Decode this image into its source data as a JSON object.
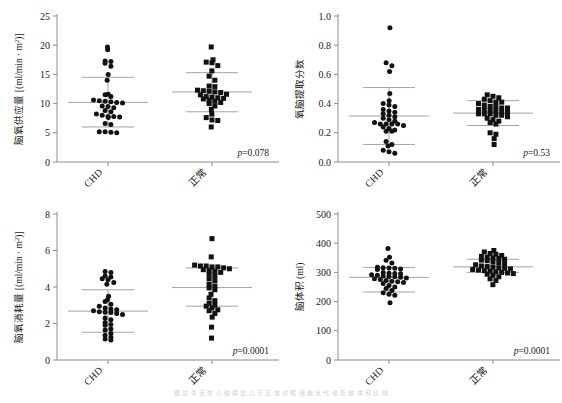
{
  "figure": {
    "caption": "图 注 先 天 性 心 脏 病 患 儿 与 正 常 对 照 组 脑 氧 代 谢 及 脑 体 积 比 较",
    "groups": [
      "CHD",
      "正常"
    ],
    "panel_count": 4
  },
  "chart_data": [
    {
      "id": "panel-brain-oxygen-delivery",
      "position": "top-left",
      "type": "scatter",
      "title": "",
      "xlabel": "",
      "ylabel": "脑氧供应量 [(ml/min · m²)]",
      "ylabel_main": "脑氧供应量",
      "ylabel_unit": "[(ml/min · m",
      "ylabel_exp": "2",
      "ylabel_tail": ")]",
      "ylim": [
        0,
        25
      ],
      "yticks": [
        0,
        5,
        10,
        15,
        20,
        25
      ],
      "ytick_labels": [
        "0",
        "5",
        "10",
        "15",
        "20",
        "25"
      ],
      "categories": [
        "CHD",
        "正常"
      ],
      "annotation": "p=0.078",
      "annotation_p": "p",
      "annotation_val": "=0.078",
      "grid": false,
      "legend": "none",
      "series": [
        {
          "name": "CHD",
          "marker": "circle",
          "mean": 10.2,
          "sd_upper": 14.5,
          "sd_lower": 6.0,
          "n": 31,
          "values": [
            19.7,
            19.2,
            17.3,
            17.2,
            16.9,
            16.4,
            15.0,
            14.0,
            11.6,
            11.5,
            11.2,
            10.6,
            10.5,
            10.4,
            10.3,
            10.2,
            10.1,
            9.6,
            9.5,
            9.3,
            8.8,
            8.6,
            8.2,
            8.0,
            7.8,
            7.8,
            7.7,
            7.6,
            6.6,
            6.4,
            5.2,
            5.2,
            5.1,
            5.0
          ]
        },
        {
          "name": "正常",
          "marker": "square",
          "mean": 12.0,
          "sd_upper": 15.3,
          "sd_lower": 8.6,
          "n": 31,
          "values": [
            19.7,
            17.5,
            17.1,
            17.0,
            16.5,
            15.6,
            14.7,
            14.0,
            13.0,
            12.9,
            12.3,
            12.2,
            12.1,
            12.0,
            11.9,
            11.6,
            11.5,
            11.2,
            11.1,
            11.0,
            10.9,
            10.8,
            10.6,
            10.4,
            10.2,
            10.0,
            9.6,
            9.0,
            8.2,
            7.6,
            7.2,
            7.1,
            6.0
          ]
        }
      ]
    },
    {
      "id": "panel-oxygen-extraction-fraction",
      "position": "top-right",
      "type": "scatter",
      "title": "",
      "xlabel": "",
      "ylabel": "氧脑提取分数",
      "ylabel_main": "氧脑提取分数",
      "ylabel_unit": "",
      "ylabel_exp": "",
      "ylabel_tail": "",
      "ylim": [
        0.0,
        1.0
      ],
      "yticks": [
        0.0,
        0.2,
        0.4,
        0.6,
        0.8,
        1.0
      ],
      "ytick_labels": [
        "0.0",
        "0.2",
        "0.4",
        "0.6",
        "0.8",
        "1.0"
      ],
      "categories": [
        "CHD",
        "正常"
      ],
      "annotation": "p=0.53",
      "annotation_p": "p",
      "annotation_val": "=0.53",
      "grid": false,
      "legend": "none",
      "series": [
        {
          "name": "CHD",
          "marker": "circle",
          "mean": 0.315,
          "sd_upper": 0.51,
          "sd_lower": 0.12,
          "n": 32,
          "values": [
            0.92,
            0.68,
            0.66,
            0.62,
            0.47,
            0.42,
            0.4,
            0.39,
            0.38,
            0.36,
            0.35,
            0.34,
            0.33,
            0.32,
            0.31,
            0.3,
            0.29,
            0.28,
            0.27,
            0.26,
            0.26,
            0.26,
            0.26,
            0.25,
            0.24,
            0.23,
            0.22,
            0.21,
            0.21,
            0.14,
            0.12,
            0.11,
            0.08,
            0.07,
            0.06
          ]
        },
        {
          "name": "正常",
          "marker": "square",
          "mean": 0.335,
          "sd_upper": 0.42,
          "sd_lower": 0.25,
          "n": 32,
          "values": [
            0.46,
            0.45,
            0.44,
            0.43,
            0.42,
            0.41,
            0.41,
            0.4,
            0.39,
            0.38,
            0.38,
            0.37,
            0.37,
            0.36,
            0.36,
            0.35,
            0.35,
            0.34,
            0.34,
            0.33,
            0.33,
            0.33,
            0.32,
            0.32,
            0.31,
            0.3,
            0.29,
            0.28,
            0.27,
            0.26,
            0.2,
            0.19,
            0.16,
            0.12
          ]
        }
      ]
    },
    {
      "id": "panel-brain-oxygen-consumption",
      "position": "bottom-left",
      "type": "scatter",
      "title": "",
      "xlabel": "",
      "ylabel": "脑氧消耗量 [(ml/min · m²)]",
      "ylabel_main": "脑氧消耗量",
      "ylabel_unit": "[(ml/min · m",
      "ylabel_exp": "2",
      "ylabel_tail": ")]",
      "ylim": [
        0,
        8
      ],
      "yticks": [
        0,
        2,
        4,
        6,
        8
      ],
      "ytick_labels": [
        "0",
        "2",
        "4",
        "6",
        "8"
      ],
      "categories": [
        "CHD",
        "正常"
      ],
      "annotation": "p=0.0001",
      "annotation_p": "p",
      "annotation_val": "=0.0001",
      "grid": false,
      "legend": "none",
      "series": [
        {
          "name": "CHD",
          "marker": "circle",
          "mean": 2.68,
          "sd_upper": 3.85,
          "sd_lower": 1.52,
          "n": 32,
          "values": [
            4.85,
            4.8,
            4.6,
            4.55,
            4.45,
            4.4,
            4.25,
            4.15,
            3.5,
            3.3,
            3.2,
            3.05,
            2.95,
            2.85,
            2.8,
            2.75,
            2.7,
            2.65,
            2.62,
            2.6,
            2.55,
            2.5,
            2.3,
            2.2,
            2.05,
            1.95,
            1.9,
            1.7,
            1.65,
            1.45,
            1.35,
            1.25,
            1.15,
            1.1
          ]
        },
        {
          "name": "正常",
          "marker": "square",
          "mean": 3.97,
          "sd_upper": 5.05,
          "sd_lower": 2.95,
          "n": 32,
          "values": [
            6.65,
            5.65,
            5.2,
            5.15,
            5.15,
            5.1,
            5.1,
            5.05,
            5.0,
            4.95,
            4.9,
            4.85,
            4.8,
            4.7,
            4.6,
            4.45,
            4.35,
            4.15,
            4.05,
            3.95,
            3.85,
            3.6,
            3.4,
            3.25,
            3.1,
            3.0,
            2.95,
            2.85,
            2.75,
            2.7,
            2.55,
            2.35,
            1.8,
            1.2
          ]
        }
      ]
    },
    {
      "id": "panel-brain-volume",
      "position": "bottom-right",
      "type": "scatter",
      "title": "",
      "xlabel": "",
      "ylabel": "脑体积 (ml)",
      "ylabel_main": "脑体积 (ml)",
      "ylabel_unit": "",
      "ylabel_exp": "",
      "ylabel_tail": "",
      "ylim": [
        0,
        500
      ],
      "yticks": [
        0,
        100,
        200,
        300,
        400,
        500
      ],
      "ytick_labels": [
        "0",
        "100",
        "200",
        "300",
        "400",
        "500"
      ],
      "categories": [
        "CHD",
        "正常"
      ],
      "annotation": "p=0.0001",
      "annotation_p": "p",
      "annotation_val": "=0.0001",
      "grid": false,
      "legend": "none",
      "series": [
        {
          "name": "CHD",
          "marker": "circle",
          "mean": 283,
          "sd_upper": 317,
          "sd_lower": 233,
          "n": 32,
          "values": [
            382,
            352,
            342,
            332,
            318,
            316,
            315,
            314,
            312,
            310,
            300,
            297,
            296,
            295,
            292,
            290,
            288,
            286,
            285,
            283,
            281,
            278,
            276,
            272,
            270,
            268,
            265,
            262,
            255,
            250,
            245,
            238,
            230,
            225,
            222,
            196
          ]
        },
        {
          "name": "正常",
          "marker": "square",
          "mean": 319,
          "sd_upper": 345,
          "sd_lower": 300,
          "n": 32,
          "values": [
            375,
            370,
            365,
            362,
            358,
            355,
            352,
            350,
            348,
            345,
            342,
            340,
            336,
            333,
            330,
            326,
            322,
            320,
            318,
            316,
            314,
            312,
            310,
            308,
            306,
            304,
            302,
            300,
            298,
            296,
            294,
            290,
            285,
            278,
            272,
            258
          ]
        }
      ]
    }
  ]
}
